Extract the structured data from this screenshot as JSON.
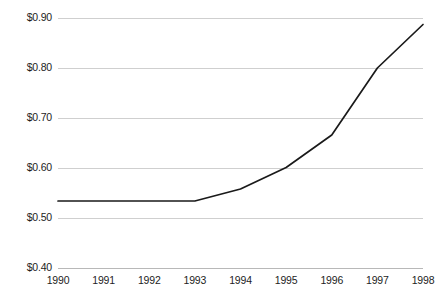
{
  "chart_data": {
    "type": "line",
    "title": "",
    "subtitle": "",
    "xlabel": "",
    "ylabel": "",
    "grid": true,
    "legend": false,
    "legend_position": "none",
    "line_color": "#1a1a1a",
    "gridline_color": "#cfcfcf",
    "background_color": "#ffffff",
    "text_color": "#1d1d1d",
    "x": [
      1990,
      1991,
      1992,
      1993,
      1994,
      1995,
      1996,
      1997,
      1998
    ],
    "categories": [
      "1990",
      "1991",
      "1992",
      "1993",
      "1994",
      "1995",
      "1996",
      "1997",
      "1998"
    ],
    "values": [
      0.534,
      0.534,
      0.534,
      0.534,
      0.558,
      0.601,
      0.666,
      0.8,
      0.887
    ],
    "xlim": [
      1990,
      1998
    ],
    "ylim": [
      0.4,
      0.9
    ],
    "y_ticks": [
      0.4,
      0.5,
      0.6,
      0.7,
      0.8,
      0.9
    ],
    "y_tick_labels": [
      "$0.40",
      "$0.50",
      "$0.60",
      "$0.70",
      "$0.80",
      "$0.90"
    ],
    "x_ticks": [
      1990,
      1991,
      1992,
      1993,
      1994,
      1995,
      1996,
      1997,
      1998
    ],
    "x_tick_labels": [
      "1990",
      "1991",
      "1992",
      "1993",
      "1994",
      "1995",
      "1996",
      "1997",
      "1998"
    ],
    "annotations": []
  }
}
